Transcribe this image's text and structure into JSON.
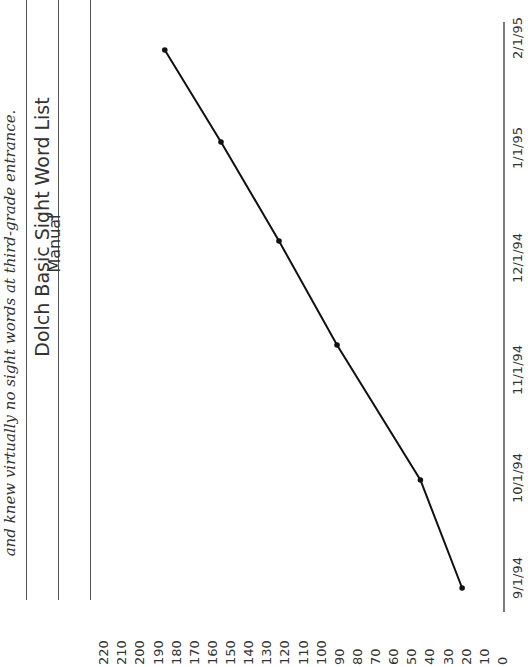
{
  "caption": "and knew virtually no sight words at third-grade entrance.",
  "table": {
    "title": "Dolch Basic Sight Word List",
    "subtitle": "Manual"
  },
  "chart_data": {
    "type": "line",
    "orientation": "rotated 90° counter-clockwise",
    "title": "Dolch Basic Sight Word List",
    "subtitle": "Manual",
    "xlabel": "",
    "ylabel": "",
    "categories": [
      "9/1/94",
      "10/1/94",
      "11/1/94",
      "12/1/94",
      "1/1/95",
      "2/1/95"
    ],
    "series": [
      {
        "name": "Sight words known",
        "values": [
          22,
          45,
          91,
          123,
          155,
          186
        ]
      }
    ],
    "yticks": [
      0,
      10,
      20,
      30,
      40,
      50,
      60,
      70,
      80,
      90,
      100,
      110,
      120,
      130,
      140,
      150,
      160,
      170,
      180,
      190,
      200,
      210,
      220
    ],
    "ylim": [
      0,
      220
    ],
    "grid": false,
    "legend": "none",
    "line_color": "#111111"
  }
}
